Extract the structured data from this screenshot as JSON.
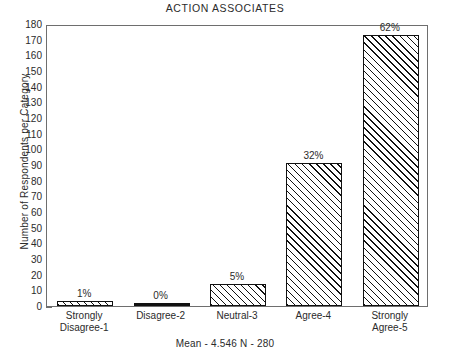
{
  "chart_data": {
    "type": "bar",
    "title": "ACTION ASSOCIATES",
    "xlabel": "",
    "ylabel": "Number of Respondents per Category",
    "categories": [
      "Strongly Disagree-1",
      "Disagree-2",
      "Neutral-3",
      "Agree-4",
      "Strongly Agree-5"
    ],
    "category_lines": [
      [
        "Strongly",
        "Disagree-1"
      ],
      [
        "Disagree-2"
      ],
      [
        "Neutral-3"
      ],
      [
        "Agree-4"
      ],
      [
        "Strongly",
        "Agree-5"
      ]
    ],
    "values": [
      3,
      1,
      14,
      91,
      173
    ],
    "data_labels": [
      "1%",
      "0%",
      "5%",
      "32%",
      "62%"
    ],
    "percentages": [
      1,
      0,
      5,
      32,
      62
    ],
    "ylim": [
      0,
      180
    ],
    "ytick_step": 10,
    "yticks": [
      0,
      10,
      20,
      30,
      40,
      50,
      60,
      70,
      80,
      90,
      100,
      110,
      120,
      130,
      140,
      150,
      160,
      170,
      180
    ],
    "grid": false,
    "legend": false,
    "bar_style": "diagonal-hatch",
    "bar_edge_color": "#111111",
    "bar_fill_color": "#ffffff",
    "frame_color": "#6e6e6e",
    "footer": "Mean - 4.546  N - 280",
    "statistics": {
      "mean_label": "Mean",
      "mean_value": "4.546",
      "n_label": "N",
      "n_value": "280"
    }
  }
}
